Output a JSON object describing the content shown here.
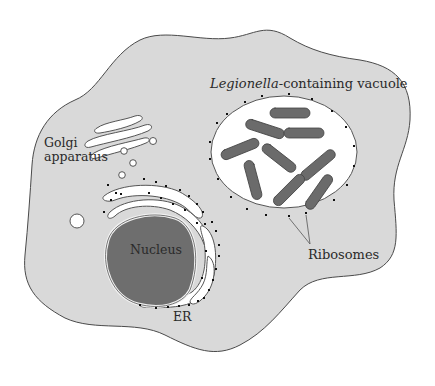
{
  "diagram": {
    "colors": {
      "background": "#ffffff",
      "cytoplasm": "#d9d9d9",
      "outline": "#4a4a4a",
      "vacuole": "#ffffff",
      "bacteria": "#6b6b6b",
      "nucleus": "#6e6e6e",
      "ribosome": "#111111",
      "text": "#2a2a2a"
    },
    "labels": {
      "vacuole_italic": "Legionella",
      "vacuole_rest": "-containing vacuole",
      "golgi_line1": "Golgi",
      "golgi_line2": "apparatus",
      "nucleus": "Nucleus",
      "ribosomes": "Ribosomes",
      "er": "ER"
    },
    "components": [
      "cell-membrane",
      "golgi-apparatus",
      "vesicles",
      "nucleus",
      "endoplasmic-reticulum",
      "legionella-containing-vacuole",
      "legionella-bacteria",
      "ribosomes"
    ]
  }
}
